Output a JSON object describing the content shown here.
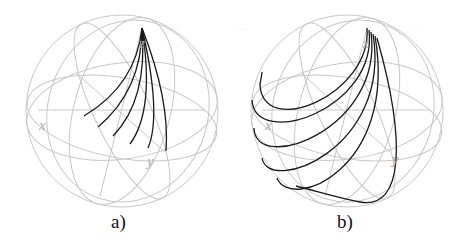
{
  "figure": {
    "panels": [
      {
        "id": "a",
        "caption": "a)",
        "axes": {
          "x": "x",
          "y": "y",
          "z": "z"
        },
        "trajectory_count": 6,
        "description": "Fan of 6 short curves from near the z-pole toward the equator region"
      },
      {
        "id": "b",
        "caption": "b)",
        "axes": {
          "x": "x",
          "y": "y",
          "z": "z"
        },
        "trajectory_count": 6,
        "description": "Fan of 6 long curves from near the z-pole sweeping around the sphere past the x-axis"
      }
    ],
    "colors": {
      "grid": "#c8c8c8",
      "trajectory": "#1a1a1a",
      "axis_label": "#a8a8a8",
      "background": "#ffffff"
    }
  }
}
